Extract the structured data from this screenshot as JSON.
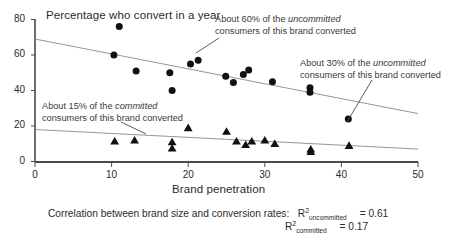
{
  "chart_data": {
    "type": "scatter",
    "title": "Percentage who convert in a year",
    "xlabel": "Brand penetration",
    "ylabel": "Percentage who convert in a year",
    "xlim": [
      0,
      50
    ],
    "ylim": [
      0,
      80
    ],
    "xticks": [
      0,
      10,
      20,
      30,
      40,
      50
    ],
    "yticks": [
      0,
      20,
      40,
      60,
      80
    ],
    "grid": false,
    "legend_position": "none",
    "series": [
      {
        "name": "uncommitted",
        "marker": "circle",
        "color": "#111111",
        "points": [
          [
            11.0,
            76.0
          ],
          [
            10.3,
            60.0
          ],
          [
            13.2,
            51.0
          ],
          [
            17.6,
            50.0
          ],
          [
            17.9,
            40.0
          ],
          [
            20.3,
            55.0
          ],
          [
            21.3,
            57.0
          ],
          [
            24.9,
            48.0
          ],
          [
            25.9,
            44.5
          ],
          [
            27.2,
            49.0
          ],
          [
            27.9,
            51.5
          ],
          [
            31.0,
            45.0
          ],
          [
            35.9,
            41.5
          ],
          [
            35.9,
            39.0
          ],
          [
            40.9,
            24.0
          ]
        ]
      },
      {
        "name": "committed",
        "marker": "triangle",
        "color": "#111111",
        "points": [
          [
            10.4,
            11.5
          ],
          [
            13.0,
            12.0
          ],
          [
            17.9,
            11.0
          ],
          [
            17.9,
            7.5
          ],
          [
            20.0,
            19.0
          ],
          [
            25.0,
            17.0
          ],
          [
            26.3,
            11.5
          ],
          [
            27.5,
            9.5
          ],
          [
            28.3,
            11.5
          ],
          [
            30.0,
            12.0
          ],
          [
            31.3,
            10.0
          ],
          [
            36.0,
            7.0
          ],
          [
            36.0,
            5.5
          ],
          [
            41.0,
            9.0
          ]
        ]
      }
    ],
    "trendlines": [
      {
        "name": "uncommitted-trend",
        "x1": 0.0,
        "y1": 69.0,
        "x2": 50.0,
        "y2": 27.0,
        "color": "#8a8a8a"
      },
      {
        "name": "committed-trend",
        "x1": 0.0,
        "y1": 18.0,
        "x2": 50.0,
        "y2": 7.0,
        "color": "#8a8a8a"
      }
    ],
    "annotations": [
      {
        "id": "note-60",
        "line1": "About 60% of the ",
        "emphasis1": "uncommitted",
        "line2": "consumers of this brand converted",
        "target_x": 21.3,
        "target_y": 57.0
      },
      {
        "id": "note-30",
        "line1": "About 30% of the ",
        "emphasis1": "uncommitted",
        "line2": "consumers of this brand converted",
        "target_x": 40.9,
        "target_y": 24.0
      },
      {
        "id": "note-15",
        "line1": "About 15% of the ",
        "emphasis1": "committed",
        "line2": "consumers of this brand converted",
        "target_x": 13.0,
        "target_y": 12.0
      }
    ],
    "footnote": {
      "text": "Correlation between brand size and conversion rates:",
      "rows": [
        {
          "symbol": "R",
          "superscript": "2",
          "subscript": "uncommitted",
          "equals": "= 0.61"
        },
        {
          "symbol": "R",
          "superscript": "2",
          "subscript": "committed",
          "equals": "= 0.17"
        }
      ]
    }
  }
}
